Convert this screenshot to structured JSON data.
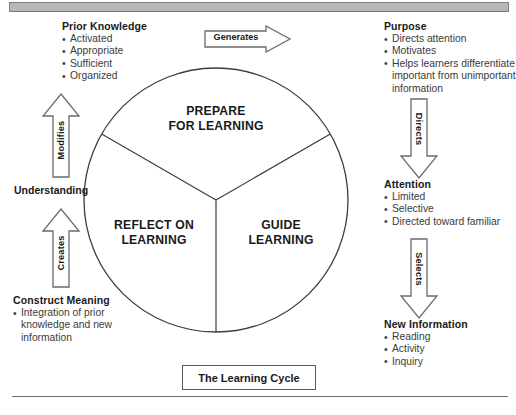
{
  "figure": {
    "caption": "The Learning Cycle",
    "top_bar": "",
    "accent_color": "#231f20",
    "bar_color": "#b8b8b8"
  },
  "circle": {
    "sectors": [
      {
        "id": "prepare",
        "label": "PREPARE\nFOR LEARNING",
        "line1": "PREPARE",
        "line2": "FOR LEARNING"
      },
      {
        "id": "guide",
        "label": "GUIDE\nLEARNING",
        "line1": "GUIDE",
        "line2": "LEARNING"
      },
      {
        "id": "reflect",
        "label": "REFLECT ON\nLEARNING",
        "line1": "REFLECT ON",
        "line2": "LEARNING"
      }
    ]
  },
  "blocks": [
    {
      "id": "prior-knowledge",
      "title": "Prior Knowledge",
      "items": [
        "Activated",
        "Appropriate",
        "Sufficient",
        "Organized"
      ]
    },
    {
      "id": "purpose",
      "title": "Purpose",
      "items": [
        "Directs attention",
        "Motivates",
        "Helps learners differentiate important from unimportant information"
      ]
    },
    {
      "id": "attention",
      "title": "Attention",
      "items": [
        "Limited",
        "Selective",
        "Directed toward familiar"
      ]
    },
    {
      "id": "new-information",
      "title": "New Information",
      "items": [
        "Reading",
        "Activity",
        "Inquiry"
      ]
    },
    {
      "id": "construct-meaning",
      "title": "Construct Meaning",
      "items": [
        "Integration of prior knowledge and new information"
      ]
    }
  ],
  "standalone_labels": [
    {
      "id": "understanding",
      "text": "Understanding"
    }
  ],
  "arrows": [
    {
      "id": "generates",
      "label": "Generates",
      "direction": "right"
    },
    {
      "id": "directs",
      "label": "Directs",
      "direction": "down"
    },
    {
      "id": "selects",
      "label": "Selects",
      "direction": "down"
    },
    {
      "id": "creates",
      "label": "Creates",
      "direction": "up"
    },
    {
      "id": "modifies",
      "label": "Modifies",
      "direction": "up"
    }
  ]
}
